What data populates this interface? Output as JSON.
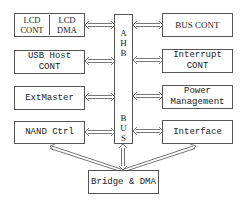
{
  "diagram": {
    "left_blocks": [
      {
        "id": "lcd",
        "parts": [
          "LCD\nCONT",
          "LCD\nDMA"
        ]
      },
      {
        "id": "usb",
        "label": "USB Host CONT"
      },
      {
        "id": "extmaster",
        "label": "ExtMaster"
      },
      {
        "id": "nand",
        "label": "NAND Ctrl"
      }
    ],
    "bus": {
      "top_label": "A\nH\nB",
      "bottom_label": "B\nU\nS"
    },
    "right_blocks": [
      {
        "id": "buscont",
        "label": "BUS CONT"
      },
      {
        "id": "interrupt",
        "label": "Interrupt\nCONT"
      },
      {
        "id": "power",
        "label": "Power\nManagement"
      },
      {
        "id": "interface",
        "label": "Interface"
      }
    ],
    "bottom_block": {
      "id": "bridge",
      "label": "Bridge & DMA"
    },
    "connections": [
      "lcd<->AHB BUS",
      "usb<->AHB BUS",
      "extmaster<->AHB BUS",
      "nand<->AHB BUS",
      "AHB BUS<->buscont",
      "AHB BUS<->interrupt",
      "AHB BUS<->power",
      "AHB BUS<->interface",
      "bridge<->AHB BUS",
      "bridge<->nand",
      "bridge<->interface"
    ],
    "line_color": "#555555"
  }
}
